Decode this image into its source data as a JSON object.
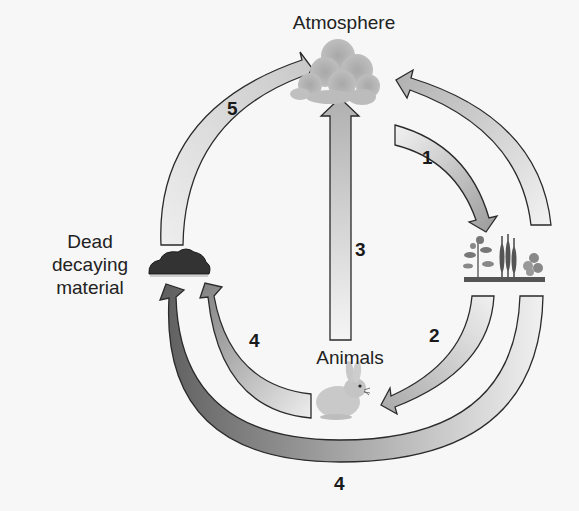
{
  "diagram": {
    "type": "carbon-cycle",
    "nodes": {
      "atmosphere": {
        "label": "Atmosphere",
        "icon": "cloud-icon"
      },
      "plants": {
        "label": "",
        "icon": "plants-icon"
      },
      "animals": {
        "label": "Animals",
        "icon": "rabbit-icon"
      },
      "dead_material": {
        "label_lines": [
          "Dead",
          "decaying",
          "material"
        ],
        "icon": "soil-mound-icon"
      }
    },
    "arrows": [
      {
        "id": "1",
        "label": "1",
        "from": "atmosphere",
        "to": "plants"
      },
      {
        "id": "2",
        "label": "2",
        "from": "plants",
        "to": "animals"
      },
      {
        "id": "3",
        "label": "3",
        "from": "animals",
        "to": "atmosphere"
      },
      {
        "id": "4a",
        "label": "4",
        "from": "animals",
        "to": "dead_material"
      },
      {
        "id": "4b",
        "label": "4",
        "from": "plants",
        "to": "dead_material"
      },
      {
        "id": "5",
        "label": "5",
        "from": "dead_material",
        "to": "atmosphere"
      },
      {
        "id": "p",
        "label": "",
        "from": "plants",
        "to": "atmosphere"
      }
    ],
    "colors": {
      "arrow_light": "#e6e6e6",
      "arrow_mid": "#b8b8b8",
      "arrow_dark": "#6a6a6a",
      "cloud": "#b5b5b5",
      "soil": "#333333",
      "outline": "#2a2a2a",
      "background": "#f7f7f7"
    }
  }
}
